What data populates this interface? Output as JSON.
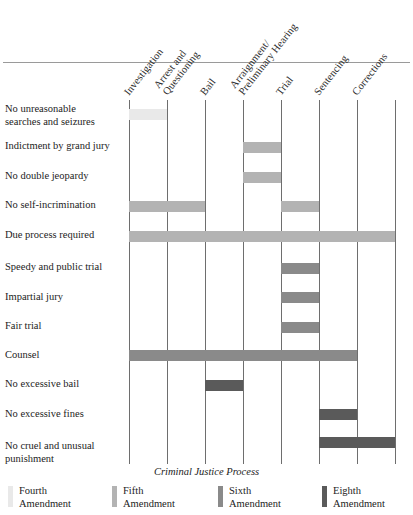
{
  "figure": {
    "axis_caption": "Criminal Justice Process"
  },
  "colors": {
    "fourth_amendment": "#e9e9e9",
    "fifth_amendment": "#b3b3b3",
    "sixth_amendment": "#8a8a8a",
    "eighth_amendment": "#5a5a5a",
    "gridline": "#6e6e6e",
    "rule": "#9a9a9a",
    "text": "#1c1c1c"
  },
  "legend": {
    "items": [
      {
        "label_line1": "Fourth",
        "label_line2": "Amendment",
        "color": "#e9e9e9",
        "swatch_name": "fourth-amendment-swatch"
      },
      {
        "label_line1": "Fifth",
        "label_line2": "Amendment",
        "color": "#b3b3b3",
        "swatch_name": "fifth-amendment-swatch"
      },
      {
        "label_line1": "Sixth",
        "label_line2": "Amendment",
        "color": "#8a8a8a",
        "swatch_name": "sixth-amendment-swatch"
      },
      {
        "label_line1": "Eighth",
        "label_line2": "Amendment",
        "color": "#5a5a5a",
        "swatch_name": "eighth-amendment-swatch"
      }
    ]
  },
  "chart_data": {
    "type": "bar",
    "orientation": "horizontal-gantt",
    "title": "",
    "subtitle": "",
    "xlabel": "Criminal Justice Process",
    "ylabel": "",
    "grid": true,
    "legend_position": "bottom-left",
    "categories": [
      "Investigation",
      "Arrest and Questioning",
      "Bail",
      "Arraignment/ Preliminary Hearing",
      "Trial",
      "Sentencing",
      "Corrections"
    ],
    "category_labels_multiline": [
      [
        "Investigation"
      ],
      [
        "Arrest and",
        "Questioning"
      ],
      [
        "Bail"
      ],
      [
        "Arraignment/",
        "Preliminary Hearing"
      ],
      [
        "Trial"
      ],
      [
        "Sentencing"
      ],
      [
        "Corrections"
      ]
    ],
    "rows": [
      {
        "label": "No unreasonable searches and seizures",
        "label_lines": [
          "No unreasonable",
          "searches and seizures"
        ],
        "amendment": "Fourth Amendment",
        "color": "#e9e9e9",
        "spans": [
          {
            "start_stage": "Investigation",
            "end_stage": "Investigation",
            "start_index": 0,
            "end_index": 0
          }
        ]
      },
      {
        "label": "Indictment by grand jury",
        "label_lines": [
          "Indictment by grand jury"
        ],
        "amendment": "Fifth Amendment",
        "color": "#b3b3b3",
        "spans": [
          {
            "start_stage": "Arraignment/ Preliminary Hearing",
            "end_stage": "Arraignment/ Preliminary Hearing",
            "start_index": 3,
            "end_index": 3
          }
        ]
      },
      {
        "label": "No double jeopardy",
        "label_lines": [
          "No double jeopardy"
        ],
        "amendment": "Fifth Amendment",
        "color": "#b3b3b3",
        "spans": [
          {
            "start_stage": "Arraignment/ Preliminary Hearing",
            "end_stage": "Arraignment/ Preliminary Hearing",
            "start_index": 3,
            "end_index": 3
          }
        ]
      },
      {
        "label": "No self-incrimination",
        "label_lines": [
          "No self-incrimination"
        ],
        "amendment": "Fifth Amendment",
        "color": "#b3b3b3",
        "spans": [
          {
            "start_stage": "Investigation",
            "end_stage": "Arrest and Questioning",
            "start_index": 0,
            "end_index": 1
          },
          {
            "start_stage": "Trial",
            "end_stage": "Trial",
            "start_index": 4,
            "end_index": 4
          }
        ]
      },
      {
        "label": "Due process required",
        "label_lines": [
          "Due process required"
        ],
        "amendment": "Fifth Amendment",
        "color": "#b3b3b3",
        "spans": [
          {
            "start_stage": "Investigation",
            "end_stage": "Corrections",
            "start_index": 0,
            "end_index": 6
          }
        ]
      },
      {
        "label": "Speedy and public trial",
        "label_lines": [
          "Speedy and public trial"
        ],
        "amendment": "Sixth Amendment",
        "color": "#8a8a8a",
        "spans": [
          {
            "start_stage": "Trial",
            "end_stage": "Trial",
            "start_index": 4,
            "end_index": 4
          }
        ]
      },
      {
        "label": "Impartial jury",
        "label_lines": [
          "Impartial jury"
        ],
        "amendment": "Sixth Amendment",
        "color": "#8a8a8a",
        "spans": [
          {
            "start_stage": "Trial",
            "end_stage": "Trial",
            "start_index": 4,
            "end_index": 4
          }
        ]
      },
      {
        "label": "Fair trial",
        "label_lines": [
          "Fair trial"
        ],
        "amendment": "Sixth Amendment",
        "color": "#8a8a8a",
        "spans": [
          {
            "start_stage": "Trial",
            "end_stage": "Trial",
            "start_index": 4,
            "end_index": 4
          }
        ]
      },
      {
        "label": "Counsel",
        "label_lines": [
          "Counsel"
        ],
        "amendment": "Sixth Amendment",
        "color": "#8a8a8a",
        "spans": [
          {
            "start_stage": "Investigation",
            "end_stage": "Sentencing",
            "start_index": 0,
            "end_index": 5
          }
        ]
      },
      {
        "label": "No excessive bail",
        "label_lines": [
          "No excessive bail"
        ],
        "amendment": "Eighth Amendment",
        "color": "#5a5a5a",
        "spans": [
          {
            "start_stage": "Bail",
            "end_stage": "Bail",
            "start_index": 2,
            "end_index": 2
          }
        ]
      },
      {
        "label": "No excessive fines",
        "label_lines": [
          "No excessive fines"
        ],
        "amendment": "Eighth Amendment",
        "color": "#5a5a5a",
        "spans": [
          {
            "start_stage": "Sentencing",
            "end_stage": "Sentencing",
            "start_index": 5,
            "end_index": 5
          }
        ]
      },
      {
        "label": "No cruel and unusual punishment",
        "label_lines": [
          "No cruel and unusual",
          "punishment"
        ],
        "amendment": "Eighth Amendment",
        "color": "#5a5a5a",
        "spans": [
          {
            "start_stage": "Sentencing",
            "end_stage": "Corrections",
            "start_index": 5,
            "end_index": 6
          }
        ]
      }
    ]
  }
}
